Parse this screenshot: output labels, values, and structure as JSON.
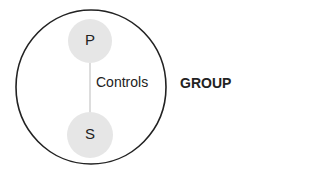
{
  "diagram": {
    "outer": {
      "label": "GROUP",
      "stroke": "#222222"
    },
    "nodes": [
      {
        "id": "P",
        "label": "P",
        "fill": "#e6e6e6"
      },
      {
        "id": "S",
        "label": "S",
        "fill": "#e6e6e6"
      }
    ],
    "edge": {
      "label": "Controls",
      "from": "P",
      "to": "S",
      "stroke": "#bbbbbb"
    }
  }
}
